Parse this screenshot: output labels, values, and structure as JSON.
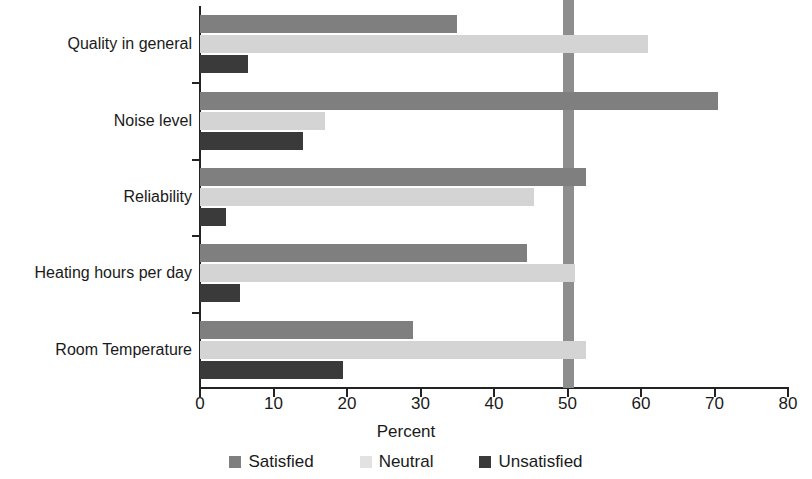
{
  "chart_data": {
    "type": "bar",
    "orientation": "horizontal",
    "title": "",
    "xlabel": "Percent",
    "ylabel": "",
    "xlim": [
      0,
      80
    ],
    "xticks": [
      0,
      10,
      20,
      30,
      40,
      50,
      60,
      70,
      80
    ],
    "grid": false,
    "legend_position": "bottom",
    "reference_line": {
      "value": 50,
      "color": "#8e8e8e"
    },
    "categories": [
      "Quality in general",
      "Noise level",
      "Reliability",
      "Heating hours per day",
      "Room Temperature"
    ],
    "series": [
      {
        "name": "Satisfied",
        "color": "#7f7f7f",
        "values": [
          35,
          70.5,
          52.5,
          44.5,
          29
        ]
      },
      {
        "name": "Neutral",
        "color": "#d4d4d4",
        "values": [
          61,
          17,
          45.5,
          51,
          52.5
        ]
      },
      {
        "name": "Unsatisfied",
        "color": "#3a3a3a",
        "values": [
          6.5,
          14,
          3.5,
          5.5,
          19.5
        ]
      }
    ]
  },
  "legend": {
    "items": [
      {
        "label": "Satisfied",
        "swatch": "satisfied-swatch"
      },
      {
        "label": "Neutral",
        "swatch": "neutral-swatch"
      },
      {
        "label": "Unsatisfied",
        "swatch": "unsatisfied-swatch"
      }
    ]
  }
}
